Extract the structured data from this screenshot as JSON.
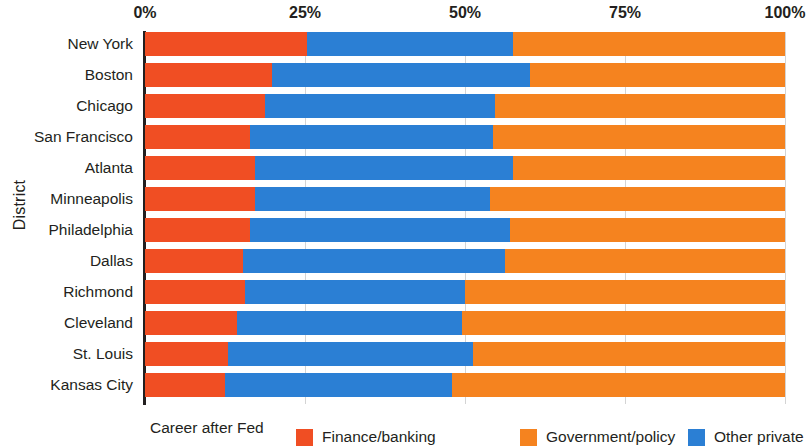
{
  "chart_data": {
    "type": "bar",
    "orientation": "horizontal",
    "stacked": true,
    "stack_total": 100,
    "title": "",
    "xlabel": "",
    "ylabel": "District",
    "xlim": [
      0,
      100
    ],
    "grid": true,
    "legend_position": "bottom",
    "legend_title": "Career after Fed",
    "x_tick_labels": [
      "0%",
      "25%",
      "50%",
      "75%",
      "100%"
    ],
    "x_tick_values": [
      0,
      25,
      50,
      75,
      100
    ],
    "categories": [
      "New York",
      "Boston",
      "Chicago",
      "San Francisco",
      "Atlanta",
      "Minneapolis",
      "Philadelphia",
      "Dallas",
      "Richmond",
      "Cleveland",
      "St. Louis",
      "Kansas City"
    ],
    "series": [
      {
        "name": "Finance/banking",
        "color": "#f04e23",
        "values": [
          25.3,
          19.8,
          18.8,
          16.4,
          17.2,
          17.2,
          16.4,
          15.3,
          15.6,
          14.4,
          13.0,
          12.5
        ]
      },
      {
        "name": "Other private",
        "color": "#2b7fd4",
        "values": [
          32.2,
          40.4,
          35.9,
          38.0,
          40.3,
          36.7,
          40.6,
          41.0,
          34.4,
          35.1,
          38.3,
          35.5
        ]
      },
      {
        "name": "Government/policy",
        "color": "#f5831f",
        "values": [
          42.5,
          39.8,
          45.3,
          45.6,
          42.5,
          46.1,
          43.0,
          43.7,
          50.0,
          50.5,
          48.7,
          52.0
        ]
      }
    ],
    "segment_order": [
      "Finance/banking",
      "Other private",
      "Government/policy"
    ]
  },
  "legend": {
    "title": "Career after Fed",
    "entries": [
      {
        "label": "Finance/banking",
        "color": "#f04e23"
      },
      {
        "label": "Government/policy",
        "color": "#f5831f"
      },
      {
        "label": "Other private",
        "color": "#2b7fd4"
      }
    ]
  },
  "axes": {
    "y_title": "District"
  }
}
